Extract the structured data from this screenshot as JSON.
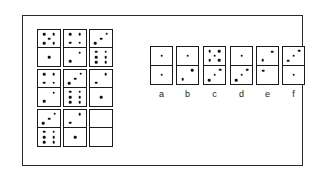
{
  "plate": {
    "title": "Domino matrix reasoning item",
    "border_color": "#2b2b2b",
    "background_color": "#ffffff",
    "pip_color": "#111111"
  },
  "matrix": {
    "name": "domino-matrix",
    "rows": 3,
    "cols": 3,
    "cells": [
      {
        "id": "r1c1",
        "row": 1,
        "col": 1,
        "top": 5,
        "bottom": 1,
        "blank": false
      },
      {
        "id": "r1c2",
        "row": 1,
        "col": 2,
        "top": 4,
        "bottom": 2,
        "blank": false
      },
      {
        "id": "r1c3",
        "row": 1,
        "col": 3,
        "top": 3,
        "bottom": 6,
        "blank": false
      },
      {
        "id": "r2c1",
        "row": 2,
        "col": 1,
        "top": 4,
        "bottom": 2,
        "blank": false
      },
      {
        "id": "r2c2",
        "row": 2,
        "col": 2,
        "top": 3,
        "bottom": 6,
        "blank": false
      },
      {
        "id": "r2c3",
        "row": 2,
        "col": 3,
        "top": 2,
        "bottom": 1,
        "blank": false
      },
      {
        "id": "r3c1",
        "row": 3,
        "col": 1,
        "top": 3,
        "bottom": 6,
        "blank": false
      },
      {
        "id": "r3c2",
        "row": 3,
        "col": 2,
        "top": 2,
        "bottom": 1,
        "blank": false
      },
      {
        "id": "r3c3",
        "row": 3,
        "col": 3,
        "top": 0,
        "bottom": 0,
        "blank": true
      }
    ]
  },
  "options": {
    "name": "answer-options",
    "items": [
      {
        "label": "a",
        "top": 1,
        "bottom": 1
      },
      {
        "label": "b",
        "top": 1,
        "bottom": 2
      },
      {
        "label": "c",
        "top": 5,
        "bottom": 3
      },
      {
        "label": "d",
        "top": 1,
        "bottom": 3
      },
      {
        "label": "e",
        "top": 2,
        "bottom": 1
      },
      {
        "label": "f",
        "top": 3,
        "bottom": 1
      }
    ]
  }
}
